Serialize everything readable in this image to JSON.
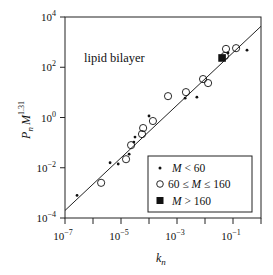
{
  "chart_data": {
    "type": "scatter",
    "title": "",
    "annotation": "lipid bilayer",
    "xlabel": "k_n",
    "ylabel": "P_n M^1.31",
    "xscale": "log",
    "yscale": "log",
    "xlim": [
      1e-07,
      1
    ],
    "ylim": [
      0.0001,
      10000.0
    ],
    "x_ticks": [
      {
        "exp": -7,
        "label": "10",
        "sup": "−7"
      },
      {
        "exp": -5,
        "label": "10",
        "sup": "−5"
      },
      {
        "exp": -3,
        "label": "10",
        "sup": "−3"
      },
      {
        "exp": -1,
        "label": "10",
        "sup": "−1"
      }
    ],
    "x_minor_tick_exps": [
      -7,
      -6,
      -5,
      -4,
      -3,
      -2,
      -1,
      0
    ],
    "y_ticks": [
      {
        "exp": 4,
        "label": "10",
        "sup": "4"
      },
      {
        "exp": 2,
        "label": "10",
        "sup": "2"
      },
      {
        "exp": 0,
        "label": "10",
        "sup": "0"
      },
      {
        "exp": -2,
        "label": "10",
        "sup": "−2"
      },
      {
        "exp": -4,
        "label": "10",
        "sup": "−4"
      }
    ],
    "grid": false,
    "legend_position": "lower right",
    "fit_line": {
      "log10_x": [
        -7,
        0
      ],
      "log10_y": [
        -3.7,
        3.63
      ]
    },
    "series": [
      {
        "name": "M < 60",
        "marker": "small-dot",
        "log10_x": [
          -6.57,
          -5.39,
          -5.1,
          -4.71,
          -4.54,
          -4.5,
          -4.0,
          -2.71,
          -2.29,
          -1.18,
          -0.5
        ],
        "log10_y": [
          -3.1,
          -1.8,
          -1.85,
          -1.46,
          -0.98,
          -0.78,
          0.06,
          0.77,
          0.81,
          2.57,
          2.68
        ]
      },
      {
        "name": "60 ≤ M ≤ 160",
        "marker": "open-circle",
        "log10_x": [
          -5.71,
          -4.82,
          -4.64,
          -4.25,
          -4.21,
          -3.86,
          -3.32,
          -2.68,
          -2.07,
          -1.89,
          -1.29,
          -1.25,
          -0.89
        ],
        "log10_y": [
          -2.6,
          -1.66,
          -1.1,
          -0.66,
          -0.42,
          -0.14,
          0.85,
          1.01,
          1.53,
          1.37,
          2.45,
          2.73,
          2.76
        ]
      },
      {
        "name": "M > 160",
        "marker": "filled-square",
        "log10_x": [
          -1.39
        ],
        "log10_y": [
          2.37
        ]
      }
    ]
  },
  "legend": {
    "items": [
      {
        "label_pre": "",
        "label_var": "M",
        "label_post": " < 60"
      },
      {
        "label_pre": "60 ≤ ",
        "label_var": "M",
        "label_post": " ≤ 160"
      },
      {
        "label_pre": "",
        "label_var": "M",
        "label_post": " > 160"
      }
    ]
  },
  "labels": {
    "annotation": "lipid bilayer",
    "xlabel_main": "k",
    "xlabel_sub": "n",
    "ylabel_main": "P",
    "ylabel_sub": "n",
    "ylabel_var": "M",
    "ylabel_sup": "1.31"
  }
}
